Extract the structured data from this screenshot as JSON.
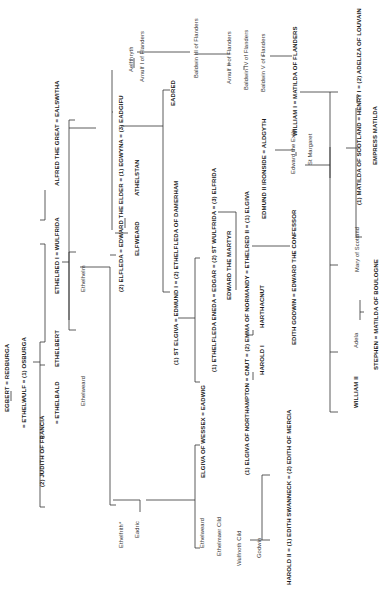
{
  "orientation": "rotated 90deg counter-clockwise",
  "people": [
    {
      "id": "egbert",
      "label": "EGBERT = REDBURGA",
      "x": 4,
      "y": 412,
      "bold": true
    },
    {
      "id": "ethelwulf",
      "label": "= ETHELWULF = (1) OSBURGA",
      "x": 21,
      "y": 428,
      "bold": true
    },
    {
      "id": "judith",
      "label": "(2) JUDITH OF FRANCIA",
      "x": 39,
      "y": 487,
      "bold": true
    },
    {
      "id": "ethelbald",
      "label": "= ETHELBALD",
      "x": 54,
      "y": 424,
      "bold": true
    },
    {
      "id": "ethelbert",
      "label": "ETHELBERT",
      "x": 54,
      "y": 367,
      "bold": true
    },
    {
      "id": "ethelred1",
      "label": "ETHELRED I = WULFRIDA",
      "x": 54,
      "y": 294,
      "bold": true
    },
    {
      "id": "alfred",
      "label": "ALFRED THE GREAT = EALSWITHA",
      "x": 54,
      "y": 186,
      "bold": true
    },
    {
      "id": "ethelweard1",
      "label": "Ethelweard",
      "x": 80,
      "y": 406,
      "bold": false
    },
    {
      "id": "ethelhelm",
      "label": "Ethelhelm",
      "x": 80,
      "y": 292,
      "bold": false
    },
    {
      "id": "ethelfrith",
      "label": "Ethelfrith*",
      "x": 118,
      "y": 548,
      "bold": false
    },
    {
      "id": "eadric",
      "label": "Eadric",
      "x": 134,
      "y": 538,
      "bold": false
    },
    {
      "id": "edward_elder",
      "label": "(2) ELFLEDA = EDWARD THE ELDER = (1) EGWYNA = (3) EADGIFU",
      "x": 118,
      "y": 292,
      "bold": true
    },
    {
      "id": "elfweard",
      "label": "ELFWEARD",
      "x": 134,
      "y": 256,
      "bold": true
    },
    {
      "id": "athelstan",
      "label": "ATHELSTAN",
      "x": 134,
      "y": 196,
      "bold": true
    },
    {
      "id": "aelfthryth",
      "label": "Aelfthryth",
      "x": 128,
      "y": 72,
      "bold": false
    },
    {
      "id": "arnulf1",
      "label": "Arnulf I of Flanders",
      "x": 139,
      "y": 82,
      "bold": false
    },
    {
      "id": "eadred",
      "label": "EADRED",
      "x": 170,
      "y": 106,
      "bold": true
    },
    {
      "id": "edmund1",
      "label": "(1)    ST ELGIVA = EDMUND I = (2) ETHELFLEDA OF DAMERHAM",
      "x": 173,
      "y": 365,
      "bold": true
    },
    {
      "id": "baldwin3",
      "label": "Baldwin III of Flanders",
      "x": 193,
      "y": 78,
      "bold": false
    },
    {
      "id": "ethelweard2",
      "label": "Ethelweard",
      "x": 199,
      "y": 548,
      "bold": false
    },
    {
      "id": "ethelmaer",
      "label": "Ethelmaer Cild",
      "x": 216,
      "y": 556,
      "bold": false
    },
    {
      "id": "elgiva_wessex",
      "label": "ELGIVA OF WESSEX = EADWIG",
      "x": 200,
      "y": 478,
      "bold": true
    },
    {
      "id": "edgar",
      "label": "(1) ETHELFLEDA ENEDA = EDGAR = (2) ST WULFRIDA = (3) ELFRIDA",
      "x": 211,
      "y": 372,
      "bold": true
    },
    {
      "id": "edward_martyr",
      "label": "EDWARD THE MARTYR",
      "x": 226,
      "y": 300,
      "bold": true
    },
    {
      "id": "arnulf2",
      "label": "Arnulf II of Flanders",
      "x": 226,
      "y": 84,
      "bold": false
    },
    {
      "id": "wulfnoth",
      "label": "Wulfnoth Cild",
      "x": 236,
      "y": 566,
      "bold": false
    },
    {
      "id": "cnut",
      "label": "(1) ELGIVA OF NORTHAMPTON = CNUT = (2) EMMA OF NORMANDY = ETHELRED II = (1) ELGIVA",
      "x": 244,
      "y": 475,
      "bold": true
    },
    {
      "id": "baldwin4",
      "label": "Baldwin IV of Flanders",
      "x": 243,
      "y": 90,
      "bold": false
    },
    {
      "id": "godwin",
      "label": "Godwin",
      "x": 256,
      "y": 558,
      "bold": false
    },
    {
      "id": "harold1",
      "label": "HAROLD I",
      "x": 259,
      "y": 375,
      "bold": true
    },
    {
      "id": "harthacnut",
      "label": "HARTHACNUT",
      "x": 259,
      "y": 328,
      "bold": true
    },
    {
      "id": "edmund2",
      "label": "EDMUND II IRONSIDE = ALDGYTH",
      "x": 261,
      "y": 219,
      "bold": true
    },
    {
      "id": "baldwin5",
      "label": "Baldwin V of Flanders",
      "x": 260,
      "y": 92,
      "bold": false
    },
    {
      "id": "harold2",
      "label": "HAROLD II = (1) EDITH SWANNECK = (2) EDITH OF MERCIA",
      "x": 286,
      "y": 585,
      "bold": true
    },
    {
      "id": "edith_godwin",
      "label": "EDITH GODWIN = EDWARD THE CONFESSOR",
      "x": 291,
      "y": 345,
      "bold": true
    },
    {
      "id": "edward_exile",
      "label": "Edward the Exile",
      "x": 290,
      "y": 174,
      "bold": false
    },
    {
      "id": "st_margaret",
      "label": "St Margaret",
      "x": 307,
      "y": 165,
      "bold": false
    },
    {
      "id": "william1",
      "label": "WILLIAM I = MATILDA OF FLANDERS",
      "x": 292,
      "y": 136,
      "bold": true
    },
    {
      "id": "william2",
      "label": "WILLIAM II",
      "x": 353,
      "y": 408,
      "bold": true
    },
    {
      "id": "adela",
      "label": "Adela",
      "x": 353,
      "y": 348,
      "bold": false
    },
    {
      "id": "stephen",
      "label": "STEPHEN = MATILDA OF BOULOGNE",
      "x": 373,
      "y": 370,
      "bold": true
    },
    {
      "id": "mary_scotland",
      "label": "Mary of Scotland",
      "x": 354,
      "y": 272,
      "bold": false
    },
    {
      "id": "henry1",
      "label": "(1) MATILDA OF SCOTLAND = HENRY I = (2) ADELIZA OF LOUVAIN",
      "x": 356,
      "y": 205,
      "bold": true
    },
    {
      "id": "empress_matilda",
      "label": "EMPRESS MATILDA",
      "x": 372,
      "y": 165,
      "bold": true
    }
  ],
  "lines": [
    [
      11,
      391,
      11,
      401
    ],
    [
      33,
      362,
      40,
      362
    ],
    [
      40,
      342,
      40,
      507
    ],
    [
      40,
      507,
      45,
      507
    ],
    [
      40,
      437,
      45,
      437
    ],
    [
      40,
      342,
      45,
      342
    ],
    [
      40,
      365,
      45,
      365
    ],
    [
      40,
      244,
      45,
      244
    ],
    [
      45,
      244,
      45,
      342
    ],
    [
      40,
      220,
      45,
      220
    ],
    [
      45,
      190,
      45,
      220
    ],
    [
      45,
      190,
      45,
      190
    ],
    [
      62,
      262,
      69,
      262
    ],
    [
      69,
      252,
      69,
      330
    ],
    [
      69,
      252,
      76,
      252
    ],
    [
      69,
      330,
      76,
      330
    ],
    [
      69,
      120,
      69,
      320
    ],
    [
      69,
      120,
      75,
      120
    ],
    [
      69,
      128,
      96,
      128
    ],
    [
      80,
      267,
      110,
      267
    ],
    [
      110,
      267,
      110,
      505
    ],
    [
      110,
      505,
      116,
      505
    ],
    [
      110,
      255,
      116,
      255
    ],
    [
      113,
      500,
      140,
      500
    ],
    [
      140,
      500,
      140,
      512
    ],
    [
      115,
      233,
      128,
      233
    ],
    [
      125,
      228,
      125,
      218
    ],
    [
      113,
      112,
      112,
      112
    ],
    [
      112,
      70,
      112,
      230
    ],
    [
      121,
      126,
      163,
      126
    ],
    [
      163,
      90,
      163,
      292
    ],
    [
      163,
      292,
      170,
      292
    ],
    [
      163,
      90,
      170,
      90
    ],
    [
      135,
      52,
      135,
      52
    ],
    [
      134,
      58,
      134,
      68
    ],
    [
      137,
      52,
      190,
      52
    ],
    [
      190,
      52,
      190,
      52
    ],
    [
      146,
      500,
      195,
      500
    ],
    [
      195,
      445,
      195,
      548
    ],
    [
      195,
      445,
      200,
      445
    ],
    [
      195,
      548,
      200,
      548
    ],
    [
      178,
      318,
      195,
      318
    ],
    [
      195,
      258,
      195,
      382
    ],
    [
      195,
      258,
      200,
      258
    ],
    [
      195,
      382,
      200,
      382
    ],
    [
      195,
      54,
      230,
      54
    ],
    [
      230,
      54,
      230,
      54
    ],
    [
      218,
      212,
      236,
      212
    ],
    [
      236,
      290,
      236,
      212
    ],
    [
      253,
      372,
      253,
      380
    ],
    [
      246,
      335,
      253,
      335
    ],
    [
      253,
      330,
      253,
      335
    ],
    [
      236,
      320,
      236,
      320
    ],
    [
      252,
      246,
      290,
      246
    ],
    [
      290,
      246,
      290,
      246
    ],
    [
      229,
      62,
      229,
      66
    ],
    [
      244,
      66,
      244,
      70
    ],
    [
      262,
      56,
      265,
      56
    ],
    [
      270,
      56,
      292,
      56
    ],
    [
      275,
      150,
      295,
      150
    ],
    [
      296,
      152,
      296,
      156
    ],
    [
      305,
      165,
      330,
      165
    ],
    [
      330,
      147,
      330,
      178
    ],
    [
      300,
      92,
      330,
      92
    ],
    [
      330,
      92,
      330,
      412
    ],
    [
      330,
      412,
      338,
      412
    ],
    [
      330,
      352,
      338,
      352
    ],
    [
      330,
      265,
      338,
      265
    ],
    [
      330,
      92,
      338,
      92
    ],
    [
      346,
      148,
      356,
      148
    ],
    [
      356,
      108,
      356,
      237
    ],
    [
      356,
      237,
      362,
      237
    ],
    [
      356,
      148,
      360,
      148
    ],
    [
      357,
      95,
      357,
      103
    ],
    [
      360,
      312,
      364,
      312
    ],
    [
      360,
      300,
      360,
      320
    ],
    [
      250,
      540,
      262,
      540
    ],
    [
      262,
      475,
      262,
      540
    ],
    [
      262,
      475,
      270,
      475
    ],
    [
      262,
      540,
      270,
      540
    ]
  ]
}
